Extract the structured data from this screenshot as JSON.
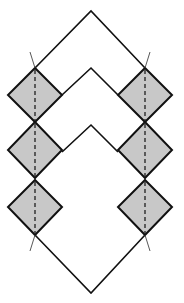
{
  "diagram": {
    "width": 184,
    "height": 303,
    "colors": {
      "background": "#ffffff",
      "stroke": "#111111",
      "diamond_fill": "#c8c8c8",
      "tick": "#444444"
    },
    "chevrons": [
      {
        "name": "outer-chevron",
        "points": [
          [
            35,
            68
          ],
          [
            91,
            11
          ],
          [
            145,
            68
          ]
        ]
      },
      {
        "name": "middle-chevron",
        "points": [
          [
            62,
            95
          ],
          [
            91,
            68
          ],
          [
            118,
            95
          ]
        ]
      },
      {
        "name": "inner-chevron",
        "points": [
          [
            62,
            152
          ],
          [
            91,
            125
          ],
          [
            118,
            152
          ]
        ]
      },
      {
        "name": "bottom-v",
        "points": [
          [
            35,
            235
          ],
          [
            91,
            293
          ],
          [
            145,
            235
          ]
        ]
      }
    ],
    "diamonds": [
      {
        "side": "left",
        "cx": 35,
        "top": 68,
        "mid": 95,
        "bottom": 122,
        "half": 27
      },
      {
        "side": "left",
        "cx": 35,
        "top": 122,
        "mid": 150,
        "bottom": 178,
        "half": 27
      },
      {
        "side": "left",
        "cx": 35,
        "top": 180,
        "mid": 207,
        "bottom": 235,
        "half": 27
      },
      {
        "side": "right",
        "cx": 145,
        "top": 68,
        "mid": 95,
        "bottom": 122,
        "half": 27
      },
      {
        "side": "right",
        "cx": 145,
        "top": 122,
        "mid": 150,
        "bottom": 178,
        "half": 27
      },
      {
        "side": "right",
        "cx": 145,
        "top": 180,
        "mid": 207,
        "bottom": 235,
        "half": 27
      }
    ],
    "ticks": [
      {
        "from": [
          35,
          68
        ],
        "to": [
          30,
          52
        ]
      },
      {
        "from": [
          145,
          68
        ],
        "to": [
          150,
          52
        ]
      },
      {
        "from": [
          35,
          235
        ],
        "to": [
          30,
          251
        ]
      },
      {
        "from": [
          145,
          235
        ],
        "to": [
          150,
          251
        ]
      }
    ]
  }
}
